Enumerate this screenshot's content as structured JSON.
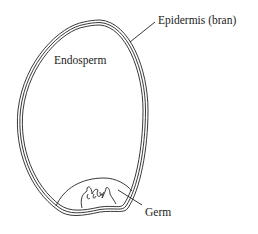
{
  "diagram": {
    "labels": {
      "epidermis": "Epidermis (bran)",
      "endosperm": "Endosperm",
      "germ": "Germ"
    }
  }
}
